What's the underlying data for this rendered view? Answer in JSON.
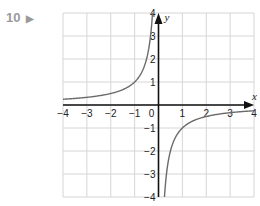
{
  "question": {
    "number": "10",
    "marker": "▶"
  },
  "chart_data": {
    "type": "line",
    "title": "",
    "function": "y = -1/x",
    "xlabel": "x",
    "ylabel": "y",
    "xlim": [
      -4,
      4
    ],
    "ylim": [
      -4,
      4
    ],
    "grid": true,
    "x_ticks": [
      "-4",
      "-3",
      "-2",
      "-1",
      "0",
      "1",
      "2",
      "3",
      "4"
    ],
    "y_ticks": [
      "4",
      "3",
      "2",
      "1",
      "-1",
      "-2",
      "-3",
      "-4"
    ],
    "series": [
      {
        "name": "left branch",
        "x": [
          -4,
          -3,
          -2,
          -1,
          -0.5,
          -0.25
        ],
        "y": [
          0.25,
          0.33,
          0.5,
          1,
          2,
          4
        ]
      },
      {
        "name": "right branch",
        "x": [
          0.25,
          0.5,
          1,
          2,
          3,
          4
        ],
        "y": [
          -4,
          -2,
          -1,
          -0.5,
          -0.33,
          -0.25
        ]
      }
    ],
    "colors": {
      "curve": "#6b6b6b",
      "axes": "#111111",
      "grid": "#d6d6d6"
    }
  }
}
